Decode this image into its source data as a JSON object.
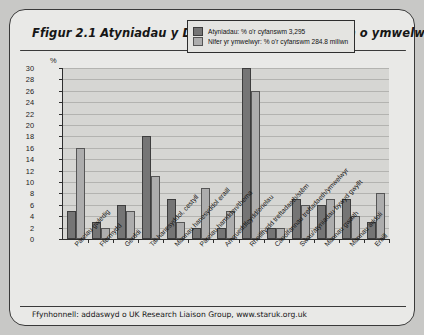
{
  "figure": {
    "title": "Ffigur 2.1  Atyniadau y DU yn ôl y math a'r gyfran o ymwelwyr",
    "source": "Ffynhonnell: addaswyd o UK Research Liaison Group, www.staruk.org.uk"
  },
  "chart_data": {
    "type": "bar",
    "title": "Ffigur 2.1  Atyniadau y DU yn ôl y math a'r gyfran o ymwelwyr",
    "xlabel": "",
    "ylabel": "%",
    "ylim": [
      0,
      30
    ],
    "ytick_step": 2,
    "yticks": [
      0,
      2,
      4,
      6,
      8,
      10,
      12,
      14,
      16,
      18,
      20,
      22,
      24,
      26,
      28,
      30
    ],
    "grid": true,
    "legend_position": "top-right",
    "categories": [
      "Parciau gwledig",
      "Ffermydd",
      "Gerddi",
      "Tai hanesyddol, cestyll",
      "Mannau hanesyddol eraill",
      "Parciau hamdden/thema",
      "Amgueddfeydd/orielau",
      "Rheilffyrdd treftadaeth/stêm",
      "Canolfannau treftadaeth/ymwelwyr",
      "Sŵau/atyniadau bywyd gwyllt",
      "Mannau gwaith",
      "Mannau addoli",
      "Eraill"
    ],
    "series": [
      {
        "name": "Atyniadau: % o'r cyfanswm 3,295",
        "color": "#757575",
        "values": [
          5,
          3,
          6,
          18,
          7,
          2,
          2,
          30,
          2,
          7,
          6,
          7,
          3
        ]
      },
      {
        "name": "Nifer yr ymwelwyr: % o'r cyfanswm 284.8 miliwn",
        "color": "#adadad",
        "values": [
          16,
          2,
          5,
          11,
          3,
          9,
          5,
          26,
          2,
          6,
          7,
          4,
          8
        ]
      }
    ]
  },
  "legend": {
    "items": [
      {
        "label": "Atyniadau: % o'r cyfanswm 3,295"
      },
      {
        "label": "Nifer yr ymwelwyr: % o'r cyfanswm 284.8 miliwn"
      }
    ]
  }
}
